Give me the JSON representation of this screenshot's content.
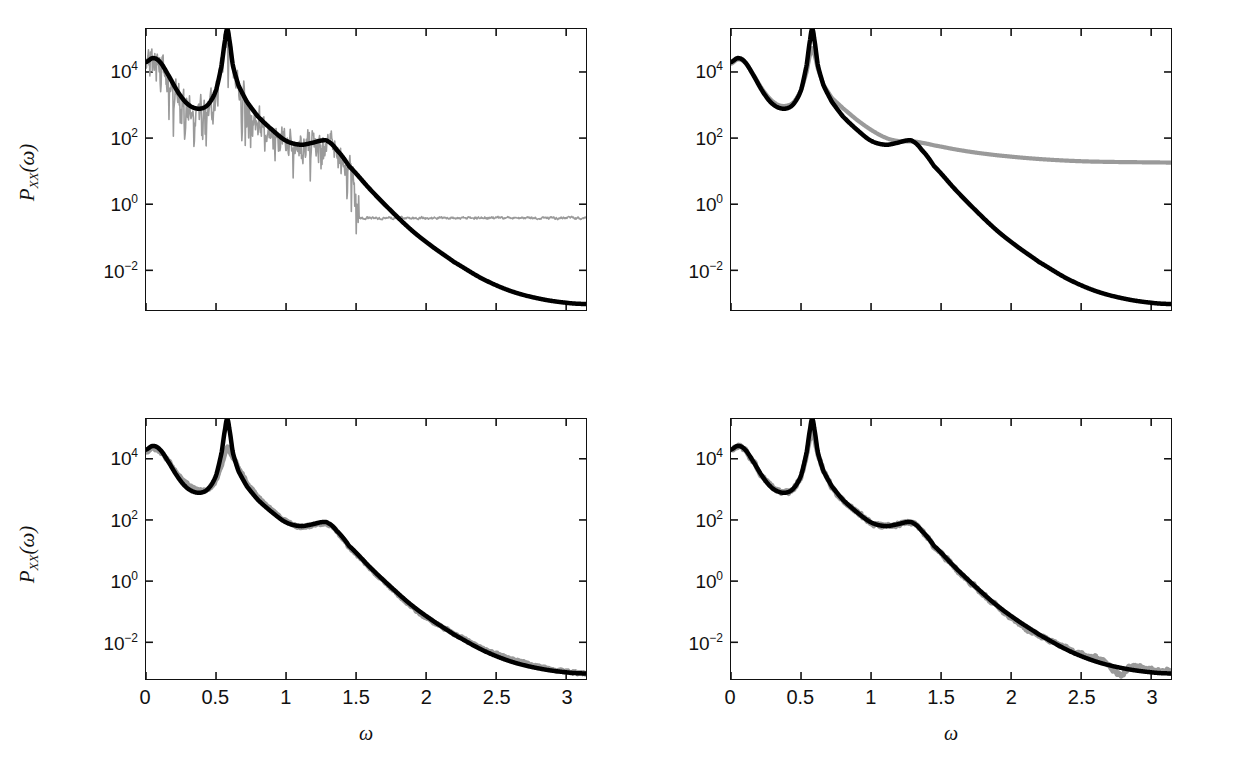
{
  "figure": {
    "background": "#ffffff",
    "series_colors": {
      "true_spectrum": "#000000",
      "estimate": "#9a9a9a"
    }
  },
  "axis": {
    "ylabel": "P",
    "ylabel_sub": "XX",
    "ylabel_arg": "(ω)",
    "xlabel": "ω",
    "yticks": [
      {
        "mantissa": "10",
        "exponent": "4",
        "value": 10000
      },
      {
        "mantissa": "10",
        "exponent": "2",
        "value": 100
      },
      {
        "mantissa": "10",
        "exponent": "0",
        "value": 1
      },
      {
        "mantissa": "10",
        "exponent": "−2",
        "value": 0.01
      }
    ],
    "xticks": [
      "0",
      "0.5",
      "1",
      "1.5",
      "2",
      "2.5",
      "3"
    ],
    "xtick_values": [
      0,
      0.5,
      1,
      1.5,
      2,
      2.5,
      3
    ]
  },
  "chart_data": [
    {
      "id": "panel-top-left",
      "type": "line",
      "title": "",
      "xlabel": "ω",
      "ylabel": "P_XX(ω)",
      "xlim": [
        0,
        3.1416
      ],
      "ylim_log10": [
        -3.2,
        5.3
      ],
      "yscale": "log",
      "grid": false,
      "legend": "none",
      "show_xticklabels": false,
      "show_yticklabels": true,
      "series": [
        {
          "name": "true_spectrum",
          "color": "#000000",
          "width": 4.5,
          "noise_log10": 0.0,
          "x": [
            0.0,
            0.05,
            0.1,
            0.16,
            0.22,
            0.28,
            0.34,
            0.4,
            0.45,
            0.5,
            0.54,
            0.566,
            0.58,
            0.594,
            0.62,
            0.66,
            0.72,
            0.8,
            0.9,
            1.0,
            1.1,
            1.18,
            1.26,
            1.3,
            1.36,
            1.45,
            1.6,
            1.75,
            1.9,
            2.05,
            2.2,
            2.4,
            2.6,
            2.8,
            3.0,
            3.1416
          ],
          "y_log10": [
            4.3,
            4.42,
            4.3,
            3.9,
            3.45,
            3.1,
            2.92,
            2.9,
            3.05,
            3.45,
            4.2,
            5.0,
            5.3,
            5.0,
            4.2,
            3.6,
            3.1,
            2.65,
            2.25,
            1.92,
            1.8,
            1.85,
            1.93,
            1.9,
            1.65,
            1.15,
            0.45,
            -0.2,
            -0.8,
            -1.3,
            -1.75,
            -2.25,
            -2.62,
            -2.85,
            -2.98,
            -3.02
          ]
        },
        {
          "name": "estimate_periodogram",
          "color": "#9a9a9a",
          "width": 1.6,
          "noise_log10": 0.95,
          "noise_until_x": 1.52,
          "plateau_log10": -0.42,
          "plateau_noise": 0.07,
          "x": [
            0.0,
            0.05,
            0.1,
            0.16,
            0.22,
            0.28,
            0.34,
            0.4,
            0.45,
            0.5,
            0.54,
            0.566,
            0.58,
            0.594,
            0.62,
            0.66,
            0.72,
            0.8,
            0.9,
            1.0,
            1.1,
            1.18,
            1.26,
            1.3,
            1.36,
            1.45,
            1.52,
            1.7,
            1.9,
            2.1,
            2.3,
            2.5,
            2.7,
            2.9,
            3.1416
          ],
          "y_log10": [
            4.3,
            4.42,
            4.3,
            3.9,
            3.45,
            3.1,
            2.92,
            2.9,
            3.05,
            3.45,
            4.2,
            4.85,
            5.05,
            4.85,
            4.2,
            3.6,
            3.1,
            2.65,
            2.25,
            1.92,
            1.8,
            1.85,
            1.93,
            1.9,
            1.65,
            1.15,
            0.1,
            -0.3,
            -0.38,
            -0.4,
            -0.42,
            -0.44,
            -0.45,
            -0.46,
            -0.47
          ]
        }
      ]
    },
    {
      "id": "panel-top-right",
      "type": "line",
      "title": "",
      "xlabel": "ω",
      "ylabel": "P_XX(ω)",
      "xlim": [
        0,
        3.1416
      ],
      "ylim_log10": [
        -3.2,
        5.3
      ],
      "yscale": "log",
      "grid": false,
      "legend": "none",
      "show_xticklabels": false,
      "show_yticklabels": true,
      "series": [
        {
          "name": "true_spectrum",
          "color": "#000000",
          "width": 4.5,
          "noise_log10": 0.0,
          "x": [
            0.0,
            0.05,
            0.1,
            0.16,
            0.22,
            0.28,
            0.34,
            0.4,
            0.45,
            0.5,
            0.54,
            0.566,
            0.58,
            0.594,
            0.62,
            0.66,
            0.72,
            0.8,
            0.9,
            1.0,
            1.1,
            1.18,
            1.26,
            1.3,
            1.36,
            1.45,
            1.6,
            1.75,
            1.9,
            2.05,
            2.2,
            2.4,
            2.6,
            2.8,
            3.0,
            3.1416
          ],
          "y_log10": [
            4.3,
            4.42,
            4.3,
            3.9,
            3.45,
            3.1,
            2.92,
            2.9,
            3.05,
            3.45,
            4.2,
            5.0,
            5.3,
            5.0,
            4.2,
            3.6,
            3.1,
            2.65,
            2.25,
            1.92,
            1.8,
            1.85,
            1.93,
            1.9,
            1.65,
            1.15,
            0.45,
            -0.2,
            -0.8,
            -1.3,
            -1.75,
            -2.25,
            -2.62,
            -2.85,
            -2.98,
            -3.02
          ]
        },
        {
          "name": "estimate_smooth_biased",
          "color": "#9a9a9a",
          "width": 4.2,
          "noise_log10": 0.0,
          "x": [
            0.0,
            0.05,
            0.1,
            0.16,
            0.22,
            0.28,
            0.34,
            0.4,
            0.45,
            0.5,
            0.54,
            0.566,
            0.58,
            0.594,
            0.62,
            0.66,
            0.72,
            0.8,
            0.9,
            1.0,
            1.1,
            1.18,
            1.26,
            1.3,
            1.36,
            1.45,
            1.6,
            1.75,
            1.9,
            2.1,
            2.3,
            2.5,
            2.7,
            2.9,
            3.1416
          ],
          "y_log10": [
            4.25,
            4.38,
            4.28,
            3.92,
            3.5,
            3.18,
            3.0,
            2.98,
            3.1,
            3.45,
            4.0,
            4.55,
            4.72,
            4.55,
            4.1,
            3.62,
            3.22,
            2.9,
            2.55,
            2.25,
            2.02,
            1.92,
            1.9,
            1.9,
            1.86,
            1.78,
            1.66,
            1.56,
            1.48,
            1.4,
            1.34,
            1.3,
            1.28,
            1.27,
            1.26
          ]
        }
      ]
    },
    {
      "id": "panel-bottom-left",
      "type": "line",
      "title": "",
      "xlabel": "ω",
      "ylabel": "P_XX(ω)",
      "xlim": [
        0,
        3.1416
      ],
      "ylim_log10": [
        -3.2,
        5.3
      ],
      "yscale": "log",
      "grid": false,
      "legend": "none",
      "show_xticklabels": true,
      "show_yticklabels": true,
      "series": [
        {
          "name": "true_spectrum",
          "color": "#000000",
          "width": 4.5,
          "noise_log10": 0.0,
          "x": [
            0.0,
            0.05,
            0.1,
            0.16,
            0.22,
            0.28,
            0.34,
            0.4,
            0.45,
            0.5,
            0.54,
            0.566,
            0.58,
            0.594,
            0.62,
            0.66,
            0.72,
            0.8,
            0.9,
            1.0,
            1.1,
            1.18,
            1.26,
            1.3,
            1.36,
            1.45,
            1.6,
            1.75,
            1.9,
            2.05,
            2.2,
            2.4,
            2.6,
            2.8,
            3.0,
            3.1416
          ],
          "y_log10": [
            4.3,
            4.42,
            4.3,
            3.9,
            3.45,
            3.1,
            2.92,
            2.9,
            3.05,
            3.45,
            4.2,
            5.0,
            5.3,
            5.0,
            4.2,
            3.6,
            3.1,
            2.65,
            2.25,
            1.92,
            1.8,
            1.85,
            1.93,
            1.9,
            1.65,
            1.15,
            0.45,
            -0.2,
            -0.8,
            -1.3,
            -1.75,
            -2.25,
            -2.62,
            -2.85,
            -2.98,
            -3.02
          ]
        },
        {
          "name": "estimate_peak_underfit",
          "color": "#9a9a9a",
          "width": 5.0,
          "noise_log10": 0.06,
          "x": [
            0.0,
            0.05,
            0.1,
            0.16,
            0.22,
            0.28,
            0.34,
            0.4,
            0.45,
            0.5,
            0.54,
            0.566,
            0.58,
            0.594,
            0.62,
            0.66,
            0.72,
            0.8,
            0.9,
            1.0,
            1.1,
            1.18,
            1.26,
            1.3,
            1.36,
            1.45,
            1.6,
            1.75,
            1.9,
            2.0,
            2.08,
            2.2,
            2.35,
            2.5,
            2.65,
            2.8,
            3.0,
            3.1416
          ],
          "y_log10": [
            4.22,
            4.33,
            4.24,
            3.92,
            3.52,
            3.22,
            3.02,
            2.96,
            3.02,
            3.3,
            3.8,
            4.2,
            4.38,
            4.26,
            4.04,
            3.7,
            3.22,
            2.74,
            2.32,
            1.95,
            1.78,
            1.82,
            1.88,
            1.86,
            1.62,
            1.12,
            0.42,
            -0.22,
            -0.84,
            -1.18,
            -1.4,
            -1.72,
            -2.08,
            -2.38,
            -2.6,
            -2.8,
            -2.95,
            -3.02
          ]
        }
      ]
    },
    {
      "id": "panel-bottom-right",
      "type": "line",
      "title": "",
      "xlabel": "ω",
      "ylabel": "P_XX(ω)",
      "xlim": [
        0,
        3.1416
      ],
      "ylim_log10": [
        -3.2,
        5.3
      ],
      "yscale": "log",
      "grid": false,
      "legend": "none",
      "show_xticklabels": true,
      "show_yticklabels": true,
      "series": [
        {
          "name": "true_spectrum",
          "color": "#000000",
          "width": 4.5,
          "noise_log10": 0.0,
          "x": [
            0.0,
            0.05,
            0.1,
            0.16,
            0.22,
            0.28,
            0.34,
            0.4,
            0.45,
            0.5,
            0.54,
            0.566,
            0.58,
            0.594,
            0.62,
            0.66,
            0.72,
            0.8,
            0.9,
            1.0,
            1.1,
            1.18,
            1.26,
            1.3,
            1.36,
            1.45,
            1.6,
            1.75,
            1.9,
            2.05,
            2.2,
            2.4,
            2.6,
            2.8,
            3.0,
            3.1416
          ],
          "y_log10": [
            4.3,
            4.42,
            4.3,
            3.9,
            3.45,
            3.1,
            2.92,
            2.9,
            3.05,
            3.45,
            4.2,
            5.0,
            5.3,
            5.0,
            4.2,
            3.6,
            3.1,
            2.65,
            2.25,
            1.92,
            1.8,
            1.85,
            1.93,
            1.9,
            1.65,
            1.15,
            0.45,
            -0.2,
            -0.8,
            -1.3,
            -1.75,
            -2.25,
            -2.62,
            -2.85,
            -2.98,
            -3.02
          ]
        },
        {
          "name": "estimate_best_match",
          "color": "#9a9a9a",
          "width": 5.0,
          "noise_log10": 0.1,
          "x": [
            0.0,
            0.05,
            0.1,
            0.16,
            0.22,
            0.28,
            0.34,
            0.4,
            0.45,
            0.5,
            0.54,
            0.566,
            0.58,
            0.594,
            0.62,
            0.66,
            0.72,
            0.8,
            0.9,
            1.0,
            1.1,
            1.18,
            1.26,
            1.3,
            1.36,
            1.45,
            1.6,
            1.75,
            1.9,
            2.0,
            2.1,
            2.2,
            2.35,
            2.5,
            2.65,
            2.78,
            2.85,
            3.0,
            3.1416
          ],
          "y_log10": [
            4.28,
            4.4,
            4.28,
            3.9,
            3.46,
            3.12,
            2.94,
            2.9,
            3.04,
            3.44,
            4.12,
            4.7,
            4.86,
            4.7,
            4.16,
            3.58,
            3.08,
            2.64,
            2.26,
            1.92,
            1.8,
            1.85,
            1.92,
            1.9,
            1.64,
            1.14,
            0.44,
            -0.22,
            -0.82,
            -1.2,
            -1.52,
            -1.78,
            -2.1,
            -2.38,
            -2.58,
            -3.05,
            -2.8,
            -2.9,
            -2.96
          ]
        }
      ]
    }
  ]
}
